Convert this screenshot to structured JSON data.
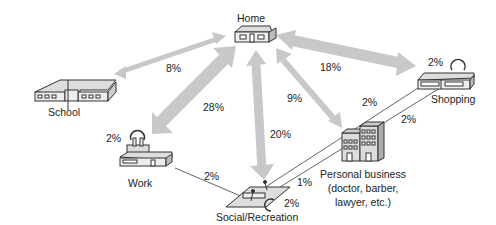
{
  "nodes": {
    "home": {
      "label": "Home"
    },
    "school": {
      "label": "School"
    },
    "shopping": {
      "label": "Shopping",
      "self_trip": "2%"
    },
    "work": {
      "label": "Work",
      "self_trip": "2%"
    },
    "social": {
      "label": "Social/Recreation",
      "self_trip": "2%"
    },
    "personal": {
      "label_line1": "Personal business",
      "label_line2": "(doctor, barber,",
      "label_line3": "lawyer, etc.)"
    }
  },
  "flows": {
    "home_school": "8%",
    "home_work": "28%",
    "home_social": "20%",
    "home_personal": "9%",
    "home_shopping": "18%",
    "work_social": "2%",
    "social_shopping": "2%",
    "personal_shopping": "2%",
    "social_personal": "1%"
  },
  "colors": {
    "arrow": "#c8c8c8",
    "line": "#555555",
    "building_fill": "#d8d8d8",
    "building_stroke": "#333333"
  }
}
